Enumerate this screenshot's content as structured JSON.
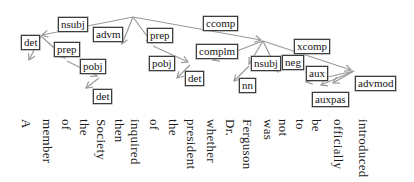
{
  "figure": {
    "type": "dependency-parse-graph",
    "background_color": "#ffffff",
    "arrow_color": "#9a9a9a",
    "box_border_color": "#3d3d3d",
    "box_fill_color": "#ffffff",
    "text_color": "#1a1a1a"
  },
  "sentence": "A member of the Society then inquired of the president whether Dr. Ferguson was not to be officially introduced",
  "words": [
    "A",
    "member",
    "of",
    "the",
    "Society",
    "then",
    "inquired",
    "of",
    "the",
    "president",
    "whether",
    "Dr.",
    "Ferguson",
    "was",
    "not",
    "to",
    "be",
    "officially",
    "introduced"
  ],
  "dependencies": [
    {
      "label": "nsubj",
      "head": "inquired",
      "dependent": "member"
    },
    {
      "label": "det",
      "head": "member",
      "dependent": "A"
    },
    {
      "label": "advm",
      "head": "inquired",
      "dependent": "then"
    },
    {
      "label": "prep",
      "head": "member",
      "dependent": "of"
    },
    {
      "label": "pobj",
      "head": "of",
      "dependent": "Society"
    },
    {
      "label": "det",
      "head": "Society",
      "dependent": "the"
    },
    {
      "label": "prep",
      "head": "inquired",
      "dependent": "of"
    },
    {
      "label": "pobj",
      "head": "of",
      "dependent": "president"
    },
    {
      "label": "det",
      "head": "president",
      "dependent": "the"
    },
    {
      "label": "ccomp",
      "head": "inquired",
      "dependent": "was"
    },
    {
      "label": "complm",
      "head": "was",
      "dependent": "whether"
    },
    {
      "label": "nsubj",
      "head": "was",
      "dependent": "Ferguson"
    },
    {
      "label": "nn",
      "head": "Ferguson",
      "dependent": "Dr."
    },
    {
      "label": "neg",
      "head": "was",
      "dependent": "not"
    },
    {
      "label": "xcomp",
      "head": "was",
      "dependent": "introduced"
    },
    {
      "label": "aux",
      "head": "introduced",
      "dependent": "to"
    },
    {
      "label": "auxpas",
      "head": "introduced",
      "dependent": "be"
    },
    {
      "label": "advmod",
      "head": "introduced",
      "dependent": "officially"
    }
  ]
}
